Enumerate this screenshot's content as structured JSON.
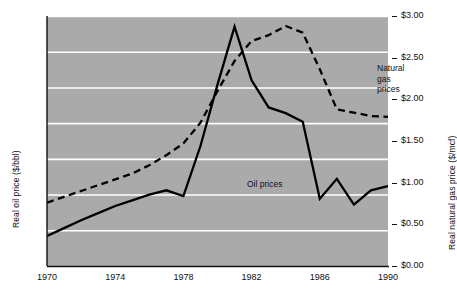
{
  "chart_data": {
    "type": "line",
    "title": "",
    "xlabel": "",
    "ylabel": "Real oil price ($/bbl)",
    "y2label": "Real natural gas price ($/mcf)",
    "xlim": [
      1970,
      1990
    ],
    "ylim": [
      5,
      40
    ],
    "y2lim": [
      0.0,
      3.0
    ],
    "grid": true,
    "legend_position": "inline-annotations",
    "plot_background": "#aaaaaa",
    "x_ticks": [
      "1970",
      "1974",
      "1978",
      "1982",
      "1986",
      "1990"
    ],
    "x_tick_values": [
      1970,
      1974,
      1978,
      1982,
      1986,
      1990
    ],
    "y_ticks_left": [
      "$5",
      "$10",
      "$15",
      "$20",
      "$25",
      "$30",
      "$35",
      "$40"
    ],
    "y_tick_values_left": [
      5,
      10,
      15,
      20,
      25,
      30,
      35,
      40
    ],
    "y_ticks_right": [
      "$0.00",
      "$0.50",
      "$1.00",
      "$1.50",
      "$2.00",
      "$2.50",
      "$3.00"
    ],
    "y_tick_values_right": [
      0.0,
      0.5,
      1.0,
      1.5,
      2.0,
      2.5,
      3.0
    ],
    "x": [
      1970,
      1971,
      1972,
      1973,
      1974,
      1975,
      1976,
      1977,
      1978,
      1979,
      1980,
      1981,
      1982,
      1983,
      1984,
      1985,
      1986,
      1987,
      1988,
      1989,
      1990
    ],
    "series": [
      {
        "name": "Oil prices",
        "axis": "left",
        "style": "solid",
        "color": "#000000",
        "units": "$/bbl",
        "values": [
          9.2,
          10.3,
          11.4,
          12.4,
          13.4,
          14.2,
          15.0,
          15.6,
          14.8,
          21.8,
          30.4,
          38.5,
          31.0,
          27.2,
          26.4,
          25.2,
          14.4,
          17.2,
          13.6,
          15.6,
          16.2
        ]
      },
      {
        "name": "Natural gas prices",
        "axis": "right",
        "style": "dashed",
        "color": "#000000",
        "units": "$/mcf",
        "values": [
          0.76,
          0.83,
          0.9,
          0.97,
          1.04,
          1.11,
          1.21,
          1.33,
          1.47,
          1.72,
          2.1,
          2.46,
          2.7,
          2.77,
          2.88,
          2.8,
          2.36,
          1.88,
          1.84,
          1.8,
          1.79
        ]
      }
    ],
    "annotations": [
      {
        "name": "natural-gas-label",
        "text": "Natural gas\nprices",
        "x": 1987.2,
        "y2": 2.45
      },
      {
        "name": "oil-label",
        "text": "Oil prices",
        "x": 1979.9,
        "y": 18.4
      }
    ]
  }
}
